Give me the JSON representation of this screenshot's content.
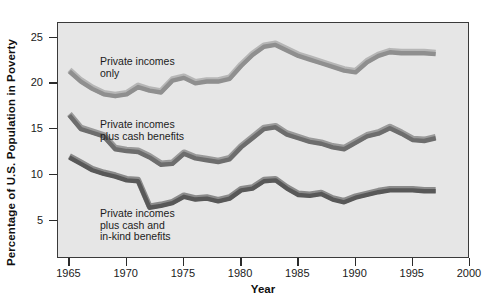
{
  "chart_data": {
    "type": "line",
    "title": "",
    "xlabel": "Year",
    "ylabel": "Percentage of U.S. Population in Poverty",
    "xlim": [
      1964,
      2000
    ],
    "ylim": [
      0.8,
      26.6
    ],
    "grid": false,
    "legend_position": "inline-annotations",
    "xticks": [
      1965,
      1970,
      1975,
      1980,
      1985,
      1990,
      1995,
      2000
    ],
    "xticklabels": [
      "1965",
      "1970",
      "1975",
      "1980",
      "1985",
      "1990",
      "1995",
      "2000"
    ],
    "yticks": [
      5,
      10,
      15,
      20,
      25
    ],
    "yticklabels": [
      "5",
      "10",
      "15",
      "20",
      "25"
    ],
    "series": [
      {
        "name": "Private incomes only",
        "label": "Private incomes\nonly",
        "color": "#8f8f8f",
        "highlight": "#b6b6b6",
        "x": [
          1965,
          1966,
          1967,
          1968,
          1969,
          1970,
          1971,
          1972,
          1973,
          1974,
          1975,
          1976,
          1977,
          1978,
          1979,
          1980,
          1981,
          1982,
          1983,
          1984,
          1985,
          1986,
          1987,
          1988,
          1989,
          1990,
          1991,
          1992,
          1993,
          1994,
          1995,
          1996,
          1997
        ],
        "y": [
          21.3,
          20.2,
          19.4,
          18.8,
          18.6,
          18.8,
          19.6,
          19.2,
          19.0,
          20.3,
          20.6,
          20.0,
          20.2,
          20.2,
          20.5,
          21.9,
          23.1,
          24.0,
          24.2,
          23.6,
          23.0,
          22.6,
          22.2,
          21.8,
          21.4,
          21.2,
          22.3,
          23.0,
          23.4,
          23.3,
          23.3,
          23.3,
          23.2
        ]
      },
      {
        "name": "Private incomes plus cash benefits",
        "label": "Private incomes\nplus cash benefits",
        "color": "#6d6d6d",
        "highlight": "#9a9a9a",
        "x": [
          1965,
          1966,
          1967,
          1968,
          1969,
          1970,
          1971,
          1972,
          1973,
          1974,
          1975,
          1976,
          1977,
          1978,
          1979,
          1980,
          1981,
          1982,
          1983,
          1984,
          1985,
          1986,
          1987,
          1988,
          1989,
          1990,
          1991,
          1992,
          1993,
          1994,
          1995,
          1996,
          1997
        ],
        "y": [
          16.5,
          15.0,
          14.6,
          14.2,
          12.8,
          12.6,
          12.5,
          11.9,
          11.1,
          11.2,
          12.3,
          11.8,
          11.6,
          11.4,
          11.7,
          13.0,
          14.0,
          15.0,
          15.2,
          14.4,
          14.0,
          13.6,
          13.4,
          13.0,
          12.8,
          13.5,
          14.2,
          14.5,
          15.1,
          14.5,
          13.8,
          13.7,
          14.0
        ]
      },
      {
        "name": "Private incomes plus cash and in-kind benefits",
        "label": "Private incomes\nplus cash and\nin-kind benefits",
        "color": "#585858",
        "highlight": "#8b8b8b",
        "x": [
          1965,
          1966,
          1967,
          1968,
          1969,
          1970,
          1971,
          1972,
          1973,
          1974,
          1975,
          1976,
          1977,
          1978,
          1979,
          1980,
          1981,
          1982,
          1983,
          1984,
          1985,
          1986,
          1987,
          1988,
          1989,
          1990,
          1991,
          1992,
          1993,
          1994,
          1995,
          1996,
          1997
        ],
        "y": [
          11.9,
          11.2,
          10.5,
          10.1,
          9.8,
          9.4,
          9.3,
          6.4,
          6.6,
          6.9,
          7.6,
          7.3,
          7.4,
          7.1,
          7.4,
          8.3,
          8.5,
          9.3,
          9.4,
          8.5,
          7.8,
          7.7,
          7.9,
          7.3,
          7.0,
          7.5,
          7.8,
          8.1,
          8.3,
          8.3,
          8.3,
          8.2,
          8.2
        ]
      }
    ]
  },
  "figure": {
    "background": "#ffffff",
    "plot_background": "#e6e6e6",
    "axis_color": "#3a3a3a"
  }
}
